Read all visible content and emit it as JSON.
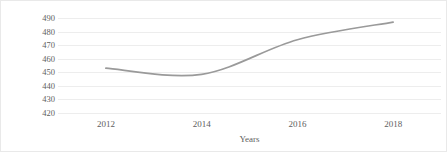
{
  "chart_data": {
    "type": "line",
    "title": "",
    "xlabel": "Years",
    "ylabel": "Kilogram Per capita",
    "x": [
      2012,
      2014,
      2016,
      2018
    ],
    "xticklabels": [
      "2012",
      "2014",
      "2016",
      "2018"
    ],
    "values": [
      453,
      448.5,
      474,
      487
    ],
    "series": [
      {
        "name": "Kilogram Per capita",
        "values": [
          453,
          448.5,
          474,
          487
        ],
        "color": "#9a9a9a"
      }
    ],
    "ylim": [
      420,
      490
    ],
    "yticks": [
      420,
      430,
      440,
      450,
      460,
      470,
      480,
      490
    ],
    "yticklabels": [
      "420",
      "430",
      "440",
      "450",
      "460",
      "470",
      "480",
      "490"
    ],
    "xlim": [
      2011,
      2019
    ],
    "grid": "horizontal",
    "legend": "none",
    "gridline_color": "#ededed",
    "text_color": "#5e5e5e",
    "line_color": "#9a9a9a",
    "border_color": "#e9e9e9",
    "background": "#ffffff"
  }
}
